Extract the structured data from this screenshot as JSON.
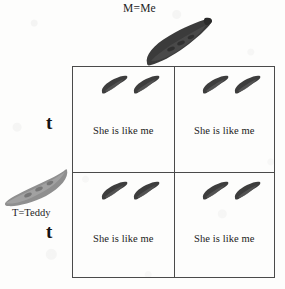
{
  "diagram": {
    "type": "punnett-square",
    "title_top": "M=Me",
    "label_left": "T=Teddy",
    "alleles": {
      "row_top": "t",
      "row_bottom": "t"
    },
    "parents": {
      "top": {
        "name": "banana-parent-top",
        "icon": "banana-icon",
        "color": "#3a3a3a"
      },
      "left": {
        "name": "banana-parent-left",
        "icon": "banana-icon",
        "color": "#8d8d8d"
      }
    },
    "grid": {
      "columns": 2,
      "rows": 2,
      "border_color": "#4a4a4a",
      "cells": [
        {
          "id": "cell-top-left",
          "caption": "She is like me",
          "offspring_count": 2,
          "offspring_icon": "banana-icon"
        },
        {
          "id": "cell-top-right",
          "caption": "She is like me",
          "offspring_count": 2,
          "offspring_icon": "banana-icon"
        },
        {
          "id": "cell-bottom-left",
          "caption": "She is like me",
          "offspring_count": 2,
          "offspring_icon": "banana-icon"
        },
        {
          "id": "cell-bottom-right",
          "caption": "She is like me",
          "offspring_count": 2,
          "offspring_icon": "banana-icon"
        }
      ]
    },
    "colors": {
      "background": "#fdfdfc",
      "ink": "#1c1c1c",
      "banana_dark": "#3a3a3a",
      "banana_light": "#8d8d8d",
      "rule": "#4a4a4a"
    }
  }
}
